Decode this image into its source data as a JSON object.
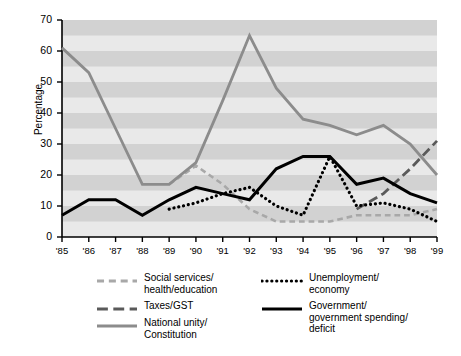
{
  "chart_data": {
    "type": "line",
    "title": "",
    "xlabel": "",
    "ylabel": "Percentage",
    "ylim": [
      0,
      70
    ],
    "ytick_step": 10,
    "grid": "alternating-horizontal-bands",
    "legend_position": "bottom",
    "x": [
      "'85",
      "'86",
      "'87",
      "'88",
      "'89",
      "'90",
      "'91",
      "'92",
      "'93",
      "'94",
      "'95",
      "'96",
      "'97",
      "'98",
      "'99"
    ],
    "yticks": [
      "0",
      "10",
      "20",
      "30",
      "40",
      "50",
      "60",
      "70"
    ],
    "series": [
      {
        "name": "Social services/\nhealth/education",
        "label_lines": [
          "Social services/",
          "health/education"
        ],
        "style": "dashed",
        "color": "#a8a8a8",
        "width": 2.6,
        "values": [
          null,
          null,
          null,
          null,
          17,
          23,
          17,
          9,
          5,
          5,
          5,
          7,
          7,
          7,
          9
        ]
      },
      {
        "name": "Taxes/GST",
        "label_lines": [
          "Taxes/GST"
        ],
        "style": "dashed-long",
        "color": "#5a5a5a",
        "width": 2.8,
        "values": [
          null,
          null,
          null,
          null,
          null,
          null,
          null,
          null,
          null,
          null,
          null,
          9,
          14,
          22,
          31
        ]
      },
      {
        "name": "National unity/\nConstitution",
        "label_lines": [
          "National unity/",
          "Constitution"
        ],
        "style": "solid",
        "color": "#8c8c8c",
        "width": 2.8,
        "values": [
          61,
          53,
          35,
          17,
          17,
          24,
          44,
          65,
          48,
          38,
          36,
          33,
          36,
          30,
          20
        ]
      },
      {
        "name": "Unemployment/\neconomy",
        "label_lines": [
          "Unemployment/",
          "economy"
        ],
        "style": "dotted",
        "color": "#000000",
        "width": 3.2,
        "values": [
          null,
          null,
          null,
          null,
          9,
          11,
          14,
          16,
          10,
          7,
          26,
          10,
          11,
          9,
          5
        ]
      },
      {
        "name": "Government/\ngovernment spending/\ndeficit",
        "label_lines": [
          "Government/",
          "government spending/",
          "deficit"
        ],
        "style": "solid",
        "color": "#000000",
        "width": 3.0,
        "values": [
          7,
          12,
          12,
          7,
          12,
          16,
          14,
          12,
          22,
          26,
          26,
          17,
          19,
          14,
          11
        ]
      }
    ]
  }
}
